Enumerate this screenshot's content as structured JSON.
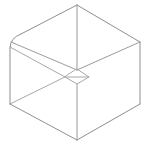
{
  "figure": {
    "canvas": {
      "width": 152,
      "height": 148,
      "background": "#ffffff"
    },
    "stroke": {
      "outline_color": "#8f8f8f",
      "interior_color": "#9b9b9b",
      "faint_color": "#a8a8a8",
      "width": 1
    },
    "vertices": {
      "top": [
        77,
        5
      ],
      "upper_left": [
        10,
        42
      ],
      "upper_right": [
        140,
        42
      ],
      "lower_left": [
        10,
        104
      ],
      "lower_right": [
        140,
        104
      ],
      "bottom": [
        77,
        140
      ],
      "center": [
        77,
        70
      ]
    },
    "outline_path": "M 77 5 L 140 42 L 140 104 L 77 140 L 10 104 L 10 42 Z",
    "edges": [
      {
        "name": "top-to-upper-right",
        "from": "top",
        "to": "upper_right"
      },
      {
        "name": "upper-right-to-lower-right",
        "from": "upper_right",
        "to": "lower_right"
      },
      {
        "name": "lower-right-to-bottom",
        "from": "lower_right",
        "to": "bottom"
      },
      {
        "name": "bottom-to-lower-left",
        "from": "bottom",
        "to": "lower_left"
      },
      {
        "name": "lower-left-to-upper-left",
        "from": "lower_left",
        "to": "upper_left"
      },
      {
        "name": "upper-left-to-top",
        "from": "upper_left",
        "to": "top"
      },
      {
        "name": "center-vertical-upper",
        "from": "top",
        "to": "center"
      },
      {
        "name": "center-to-upper-left",
        "from": "center",
        "to": "upper_left"
      },
      {
        "name": "center-to-upper-right",
        "from": "center",
        "to": "upper_right"
      },
      {
        "name": "center-to-bottom",
        "from": "center",
        "to": "bottom"
      }
    ],
    "interior_detail": {
      "name": "inner-quadrilateral",
      "path": "M 77 69 L 88 76 L 77 84 L 66 76 Z",
      "offset_edges": [
        "M 10 46 L 72 77",
        "M 72 77 L 82 72",
        "M 16 38 L 77 69"
      ]
    },
    "chamfer": {
      "name": "left-corner-chamfer",
      "path": "M 10 50 Q 10 38 22 34"
    }
  }
}
